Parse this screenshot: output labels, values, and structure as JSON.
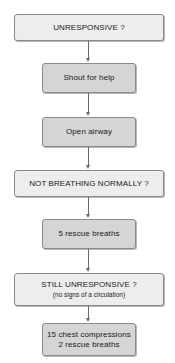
{
  "flowchart": {
    "title": "",
    "nodes": [
      {
        "id": "n1",
        "type": "question",
        "label": "UNRESPONSIVE ?",
        "sublabel": ""
      },
      {
        "id": "n2",
        "type": "action",
        "label": "Shout for help",
        "sublabel": ""
      },
      {
        "id": "n3",
        "type": "action",
        "label": "Open airway",
        "sublabel": ""
      },
      {
        "id": "n4",
        "type": "question",
        "label": "NOT BREATHING NORMALLY ?",
        "sublabel": ""
      },
      {
        "id": "n5",
        "type": "action",
        "label": "5 rescue breaths",
        "sublabel": ""
      },
      {
        "id": "n6",
        "type": "question",
        "label": "STILL UNRESPONSIVE ?",
        "sublabel": "(no signs of a circulation)"
      },
      {
        "id": "n7",
        "type": "action",
        "label": "15 chest compressions",
        "sublabel": "2 rescue breaths"
      }
    ],
    "edges": [
      {
        "from": "n1",
        "to": "n2"
      },
      {
        "from": "n2",
        "to": "n3"
      },
      {
        "from": "n3",
        "to": "n4"
      },
      {
        "from": "n4",
        "to": "n5"
      },
      {
        "from": "n5",
        "to": "n6"
      },
      {
        "from": "n6",
        "to": "n7"
      }
    ],
    "colors": {
      "question_fill": "#ededed",
      "action_fill": "#d5d5d5",
      "border": "#8a8a8a",
      "connector": "#6a6a6a",
      "text": "#1a1a1a"
    }
  }
}
